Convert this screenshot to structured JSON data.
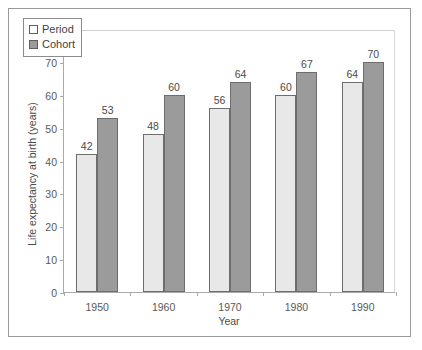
{
  "chart_data": {
    "type": "bar",
    "title": "",
    "xlabel": "Year",
    "ylabel": "Life expectancy at birth (years)",
    "categories": [
      "1950",
      "1960",
      "1970",
      "1980",
      "1990"
    ],
    "series": [
      {
        "name": "Period",
        "values": [
          42,
          48,
          56,
          60,
          64
        ],
        "color": "#e8e8e8"
      },
      {
        "name": "Cohort",
        "values": [
          53,
          60,
          64,
          67,
          70
        ],
        "color": "#9b9b9b"
      }
    ],
    "ylim": [
      0,
      80
    ],
    "yticks": [
      0,
      10,
      20,
      30,
      40,
      50,
      60,
      70,
      80
    ],
    "ytick_labels": [
      "0",
      "10",
      "20",
      "30",
      "40",
      "50",
      "60",
      "70",
      "80"
    ],
    "grid": false,
    "data_labels": true,
    "legend_position": "top-left",
    "legend": [
      "Period",
      "Cohort"
    ]
  }
}
